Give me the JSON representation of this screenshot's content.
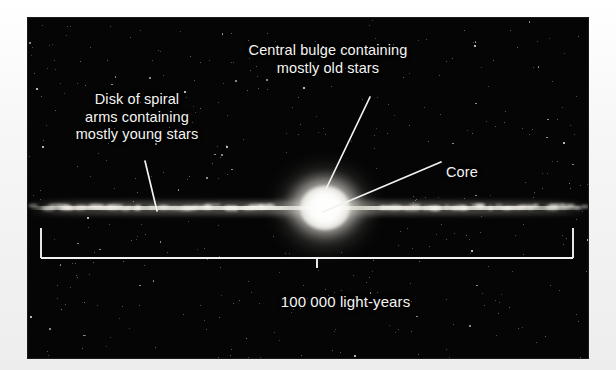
{
  "figure": {
    "kind": "astronomy-diagram",
    "background_color": "#050505",
    "text_color": "#f4f4f2",
    "margin_color": "#f6f6f6"
  },
  "labels": {
    "bulge": {
      "line1": "Central bulge containing",
      "line2": "mostly old stars"
    },
    "disk": {
      "line1": "Disk of spiral",
      "line2": "arms containing",
      "line3": "mostly young stars"
    },
    "core": {
      "text": "Core"
    },
    "scale": {
      "text": "100 000 light-years"
    }
  },
  "leader_lines": [
    {
      "name": "bulge-leader-line",
      "from_label": "Central bulge containing mostly old stars",
      "x1": 370,
      "y1": 97,
      "x2": 326,
      "y2": 189
    },
    {
      "name": "core-leader-line",
      "from_label": "Core",
      "x1": 441,
      "y1": 162,
      "x2": 323,
      "y2": 212
    },
    {
      "name": "disk-leader-line",
      "from_label": "Disk of spiral arms containing mostly young stars",
      "x1": 145,
      "y1": 161,
      "x2": 157,
      "y2": 211
    }
  ],
  "scale_bracket": {
    "name": "scale-bracket",
    "left_x": 41,
    "right_x": 573,
    "baseline_y": 258,
    "arm_top_y": 228,
    "center_tick_x": 317,
    "center_tick_bottom_y": 268,
    "measures": "100 000 light-years"
  },
  "galaxy": {
    "disk": {
      "name": "galactic-disk",
      "center_y": 211,
      "left_x": 28,
      "right_x": 588,
      "thickness_px": 5
    },
    "bulge": {
      "name": "central-bulge",
      "center_x": 322,
      "center_y": 212,
      "width_px": 130,
      "height_px": 120
    },
    "core": {
      "name": "galactic-core",
      "center_x": 322,
      "center_y": 212
    }
  },
  "plate": {
    "left": 28,
    "top": 18,
    "width": 560,
    "height": 340
  }
}
